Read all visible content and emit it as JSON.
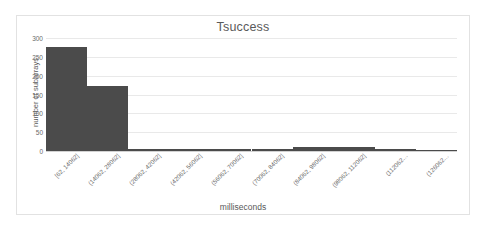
{
  "chart_data": {
    "type": "bar",
    "title": "Tsuccess",
    "xlabel": "milliseconds",
    "ylabel": "number of subarrays",
    "categories": [
      "[62, 14062]",
      "(14062, 28062]",
      "(28062, 42062]",
      "(42062, 56062]",
      "(56062, 70062]",
      "(70062, 84062]",
      "(84062, 98062]",
      "(98062, 112062]",
      "(112062…",
      "(126062…"
    ],
    "values": [
      275,
      172,
      6,
      6,
      6,
      6,
      10,
      10,
      6,
      4
    ],
    "ylim": [
      0,
      300
    ],
    "yticks": [
      0,
      50,
      100,
      150,
      200,
      250,
      300
    ],
    "ytick_labels": [
      "0",
      "50",
      "100",
      "150",
      "200",
      "250",
      "300"
    ],
    "grid": true,
    "legend": false,
    "bar_color": "#4b4b4b",
    "gridline_color": "#e9e9e9",
    "frame_color": "#e2e2e2",
    "text_color": "#5a5a5a"
  }
}
